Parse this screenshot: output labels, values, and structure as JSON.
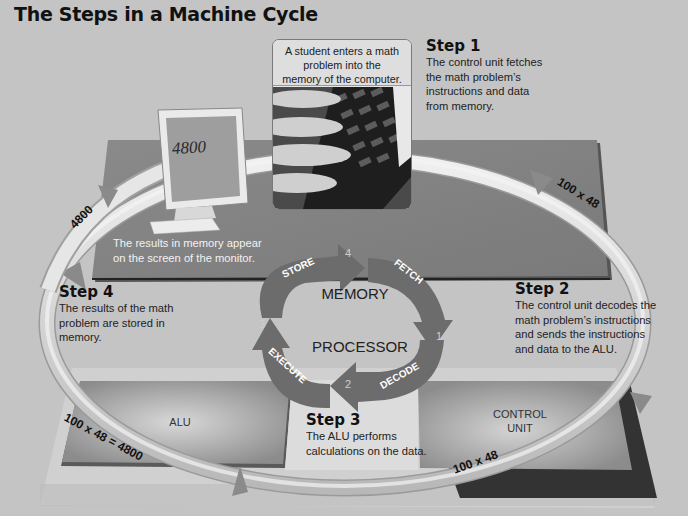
{
  "title": "The Steps in a Machine Cycle",
  "photo": {
    "caption": "A student enters a math problem into the memory of the computer.",
    "caption_lines": [
      "A student enters a math",
      "problem into the",
      "memory of the computer."
    ],
    "image_desc": "hands-typing-on-keyboard"
  },
  "monitor": {
    "screen_value": "4800",
    "caption_lines": [
      "The results in memory appear",
      "on the screen of the monitor."
    ]
  },
  "steps": [
    {
      "heading": "Step 1",
      "lines": [
        "The control unit fetches",
        "the math problem’s",
        "instructions and data",
        "from memory."
      ]
    },
    {
      "heading": "Step 2",
      "lines": [
        "The control unit decodes the",
        "math problem’s instructions",
        "and sends the instructions",
        "and data to the ALU."
      ]
    },
    {
      "heading": "Step 3",
      "lines": [
        "The ALU performs",
        "calculations on the data."
      ]
    },
    {
      "heading": "Step 4",
      "lines": [
        "The results of the math",
        "problem are stored in",
        "memory."
      ]
    }
  ],
  "cycle": {
    "center_top": "MEMORY",
    "center_bottom": "PROCESSOR",
    "stages": [
      {
        "label": "FETCH",
        "number": "1"
      },
      {
        "label": "DECODE",
        "number": "2"
      },
      {
        "label": "EXECUTE",
        "number": "3"
      },
      {
        "label": "STORE",
        "number": "4"
      }
    ]
  },
  "components": {
    "alu": "ALU",
    "control_unit_lines": [
      "CONTROL",
      "UNIT"
    ]
  },
  "ring_labels": {
    "top_right": "100 x 48",
    "bottom_right": "100 x 48",
    "bottom_left": "100 x 48 = 4800",
    "top_left": "4800"
  },
  "colors": {
    "background": "#c4c4c4",
    "plane_dark": "#8e8e8e",
    "plane_light": "#d2d2d2",
    "cycle_arrow": "#6a6a6a",
    "ring": "#e4e4e4"
  }
}
